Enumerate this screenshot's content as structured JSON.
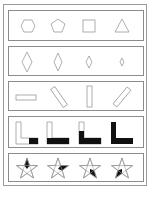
{
  "figure": {
    "type": "visual-reasoning-puzzle",
    "rows": [
      {
        "id": "polygons",
        "description": "Polygons with decreasing number of sides",
        "items": [
          "hexagon",
          "pentagon",
          "square",
          "triangle"
        ]
      },
      {
        "id": "diamonds",
        "description": "Diamonds shrinking in size",
        "items": [
          "diamond-large",
          "diamond-medium",
          "diamond-small",
          "diamond-tiny"
        ]
      },
      {
        "id": "rectangles",
        "description": "Thin rectangle rotating",
        "items": [
          "rect-0deg",
          "rect-135deg",
          "rect-90deg",
          "rect-45deg"
        ]
      },
      {
        "id": "l-shapes",
        "description": "L-shape progressively filled black",
        "items": [
          "l-fill-foot-end",
          "l-fill-foot",
          "l-fill-foot-and-lower-stem",
          "l-fill-full"
        ]
      },
      {
        "id": "stars",
        "description": "Five-point star with one shaded point rotating clockwise",
        "items": [
          "star-top-point",
          "star-right-point",
          "star-lower-right-point",
          "star-lower-left-point"
        ]
      }
    ]
  },
  "colors": {
    "stroke": "#8c8c8c",
    "fill": "#111111",
    "background": "#ffffff"
  }
}
